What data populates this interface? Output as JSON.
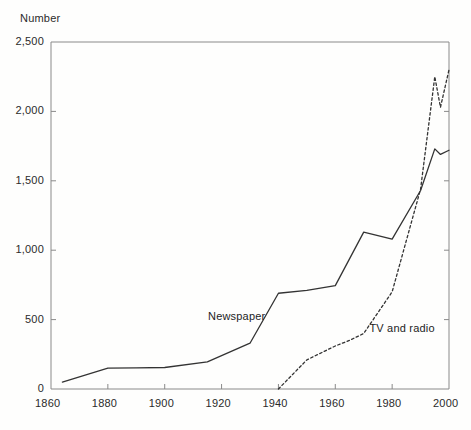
{
  "chart_data": {
    "type": "line",
    "title": "",
    "ylabel": "Number",
    "xlabel": "",
    "xlim": [
      1860,
      2000
    ],
    "ylim": [
      0,
      2500
    ],
    "grid": false,
    "legend_position": "inline-annotation",
    "x_ticks": [
      "1860",
      "1880",
      "1900",
      "1920",
      "1940",
      "1960",
      "1980",
      "2000"
    ],
    "x_tick_values": [
      1860,
      1880,
      1900,
      1920,
      1940,
      1960,
      1980,
      2000
    ],
    "y_ticks": [
      "0",
      "500",
      "1,000",
      "1,500",
      "2,000",
      "2,500"
    ],
    "y_tick_values": [
      0,
      500,
      1000,
      1500,
      2000,
      2500
    ],
    "series": [
      {
        "name": "Newspaper",
        "style": "solid",
        "color": "#333333",
        "label_x": 1930,
        "label_y": 520,
        "x": [
          1864,
          1880,
          1890,
          1900,
          1915,
          1930,
          1940,
          1950,
          1960,
          1970,
          1980,
          1990,
          1995,
          1997,
          2000
        ],
        "values": [
          50,
          150,
          152,
          155,
          195,
          330,
          690,
          710,
          745,
          1130,
          1080,
          1430,
          1730,
          1690,
          1720
        ]
      },
      {
        "name": "TV and radio",
        "style": "dashed",
        "color": "#333333",
        "label_x": 1972,
        "label_y": 430,
        "x": [
          1940,
          1950,
          1960,
          1965,
          1970,
          1980,
          1990,
          1995,
          1997,
          2000
        ],
        "values": [
          0,
          210,
          310,
          350,
          400,
          700,
          1440,
          2250,
          2030,
          2300
        ]
      }
    ]
  },
  "axis": {
    "y_title": "Number"
  }
}
